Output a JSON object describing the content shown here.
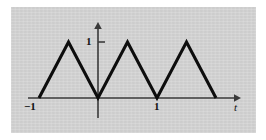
{
  "figure": {
    "name": "triangle-wave-plot",
    "background_color": "#ffffff",
    "panel_color": "#d3d3d3",
    "curve_color": "#0d0d0d",
    "axis_color": "#3a3a3a"
  },
  "labels": {
    "x_negative_one": "−1",
    "x_one": "1",
    "y_one": "1",
    "independent_variable": "t"
  },
  "chart_data": {
    "type": "line",
    "title": "",
    "subtitle": "",
    "xlabel": "t",
    "ylabel": "",
    "grid": false,
    "legend": null,
    "xlim": [
      -1.35,
      2.45
    ],
    "ylim": [
      -0.35,
      1.35
    ],
    "xticks": [
      -1,
      1
    ],
    "xticklabels": [
      "−1",
      "1"
    ],
    "yticks": [
      1
    ],
    "yticklabels": [
      "1"
    ],
    "annotations": [],
    "series": [
      {
        "name": "triangle wave",
        "color": "#0d0d0d",
        "linewidth": 3.1,
        "x": [
          -1,
          -0.5,
          0,
          0.5,
          1,
          1.5,
          2
        ],
        "y": [
          0,
          1,
          0,
          1,
          0,
          1,
          0
        ]
      }
    ]
  },
  "geometry": {
    "panel": {
      "x": 11,
      "y": 7,
      "width": 245,
      "height": 126
    },
    "origin": {
      "x": 98,
      "y": 98
    },
    "x_axis": {
      "x1": 28,
      "x2": 234,
      "y": 98,
      "arrow_tip_x": 241
    },
    "y_axis": {
      "x": 98,
      "y1": 118,
      "y2": 29,
      "arrow_tip_y": 22
    },
    "unit_x_px": 59,
    "unit_y_px": 56,
    "y_tick_one": {
      "x": 98,
      "y": 42,
      "length": 7
    },
    "wave_points_px": [
      [
        31,
        98
      ],
      [
        70,
        42
      ],
      [
        98,
        98
      ],
      [
        128,
        42
      ],
      [
        157,
        98
      ],
      [
        186,
        42
      ],
      [
        214,
        98
      ]
    ]
  }
}
